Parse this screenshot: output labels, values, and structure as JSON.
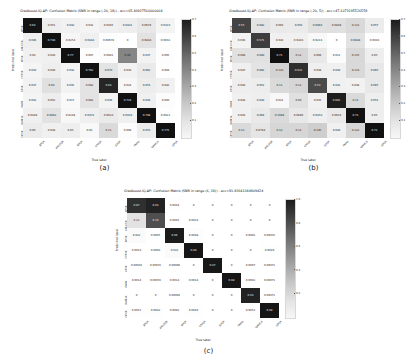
{
  "figure": {
    "background": "#ffffff",
    "colormap": "greys",
    "panels_layout": "2 on top, 1 centered below"
  },
  "panels": [
    {
      "key": "a",
      "panel_label": "(a)",
      "title": "Gradboost-IQ-AP: Confusion Matrix (SNR in range (-20, 18)) - acc=65.46937560000004",
      "xlabel": "True label",
      "ylabel": "Predicted label",
      "colorbar": {
        "ticks": [
          "0.7",
          "0.6",
          "0.5",
          "0.4",
          "0.3",
          "0.2",
          "0.1"
        ],
        "vmin": 0.0,
        "vmax": 0.7
      }
    },
    {
      "key": "b",
      "panel_label": "(b)",
      "title": "Gradboost-IQ-AP: Confusion Matrix (SNR in range (-20, 5)) - acc=47.1073195526558",
      "xlabel": "True label",
      "ylabel": "Predicted label",
      "colorbar": {
        "ticks": [
          "0.7",
          "0.6",
          "0.5",
          "0.4",
          "0.3",
          "0.2",
          "0.1"
        ],
        "vmin": 0.0,
        "vmax": 0.7
      }
    },
    {
      "key": "c",
      "panel_label": "(c)",
      "title": "Gradboost-IQ-AP: Confusion Matrix (SNR in range (6, 18)) - acc=91.83641344909424",
      "xlabel": "True label",
      "ylabel": "Predicted label",
      "colorbar": {
        "ticks": [
          "1.0",
          "0.8",
          "0.6",
          "0.4",
          "0.2"
        ],
        "vmin": 0.0,
        "vmax": 1.0
      }
    }
  ],
  "chart_data": [
    {
      "type": "heatmap",
      "panel": "a",
      "title": "Gradboost-IQ-AP: Confusion Matrix (SNR in range (-20, 18)) - acc=65.46937560000004",
      "xlabel": "True label",
      "ylabel": "Predicted label",
      "xticklabels": [
        "8PSK",
        "AM-DSB",
        "BPSK",
        "CPFSK",
        "GFSK",
        "PAM4",
        "QAM16",
        "QPSK"
      ],
      "yticklabels": [
        "8PSK",
        "AM-DSB",
        "BPSK",
        "CPFSK",
        "GFSK",
        "PAM4",
        "QAM16",
        "QPSK"
      ],
      "zlim": [
        0.0,
        0.7
      ],
      "values": [
        [
          0.69,
          0.051,
          0.042,
          0.032,
          0.0445,
          0.0491,
          0.0678,
          0.0319
        ],
        [
          0.046,
          0.744,
          0.0254,
          0.0444,
          0.00674,
          0.0,
          0.0844,
          0.0031
        ],
        [
          0.04,
          0.043,
          0.77,
          0.007,
          0.0081,
          0.36,
          0.037,
          0.005
        ],
        [
          0.033,
          0.049,
          0.032,
          0.762,
          0.079,
          0.039,
          0.062,
          0.004
        ],
        [
          0.037,
          0.09,
          0.035,
          0.082,
          0.64,
          0.024,
          0.053,
          0.042
        ],
        [
          0.032,
          0.052,
          0.017,
          0.082,
          0.036,
          0.714,
          0.044,
          0.009
        ],
        [
          0.0448,
          0.0862,
          0.0248,
          0.0472,
          0.0619,
          0.0433,
          0.748,
          0.0021
        ],
        [
          0.06,
          0.044,
          0.05,
          0.02,
          0.11,
          0.008,
          0.053,
          0.771
        ]
      ]
    },
    {
      "type": "heatmap",
      "panel": "b",
      "title": "Gradboost-IQ-AP: Confusion Matrix (SNR in range (-20, 5)) - acc=47.1073195526558",
      "xlabel": "True label",
      "ylabel": "Predicted label",
      "xticklabels": [
        "8PSK",
        "AM-DSB",
        "BPSK",
        "CPFSK",
        "GFSK",
        "PAM4",
        "QAM16",
        "QPSK"
      ],
      "yticklabels": [
        "8PSK",
        "AM-DSB",
        "BPSK",
        "CPFSK",
        "GFSK",
        "PAM4",
        "QAM16",
        "QPSK"
      ],
      "zlim": [
        0.0,
        0.7
      ],
      "values": [
        [
          0.55,
          0.082,
          0.063,
          0.059,
          0.0869,
          0.0898,
          0.112,
          0.057
        ],
        [
          0.036,
          0.571,
          0.043,
          0.0443,
          0.0213,
          0.0,
          0.0848,
          0.0043
        ],
        [
          0.088,
          0.089,
          0.71,
          0.12,
          0.068,
          0.011,
          0.115,
          0.05
        ],
        [
          0.047,
          0.082,
          0.129,
          0.611,
          0.048,
          0.044,
          0.113,
          0.067
        ],
        [
          0.049,
          0.052,
          0.11,
          0.12,
          0.53,
          0.041,
          0.038,
          0.067
        ],
        [
          0.044,
          0.049,
          0.021,
          0.09,
          0.041,
          0.662,
          0.11,
          0.051
        ],
        [
          0.043,
          0.064,
          0.1088,
          0.0686,
          0.0459,
          0.0654,
          0.71,
          0.05
        ],
        [
          0.11,
          0.0764,
          0.12,
          0.12,
          0.145,
          0.043,
          0.122,
          0.71
        ]
      ]
    },
    {
      "type": "heatmap",
      "panel": "c",
      "title": "Gradboost-IQ-AP: Confusion Matrix (SNR in range (6, 18)) - acc=91.83641344909424",
      "xlabel": "True label",
      "ylabel": "Predicted label",
      "xticklabels": [
        "8PSK",
        "AM-DSB",
        "BPSK",
        "CPFSK",
        "GFSK",
        "PAM4",
        "QAM16",
        "QPSK"
      ],
      "yticklabels": [
        "8PSK",
        "AM-DSB",
        "BPSK",
        "CPFSK",
        "GFSK",
        "PAM4",
        "QAM16",
        "QPSK"
      ],
      "zlim": [
        0.0,
        1.0
      ],
      "values": [
        [
          0.87,
          0.93,
          0.0044,
          0.0,
          0.0,
          0.0,
          0.0,
          0.0
        ],
        [
          0.12,
          0.74,
          0.0001,
          0.0014,
          0.0,
          0.0,
          0.0,
          0.0
        ],
        [
          0.022,
          0.0005,
          0.96,
          0.0098,
          0.0,
          0.0,
          0.0002,
          0.00072
        ],
        [
          0.0019,
          0.0009,
          0.022,
          0.98,
          0.0,
          0.0,
          0.0,
          0.0028
        ],
        [
          0.00033,
          0.00072,
          0.00066,
          0.0,
          0.97,
          0.0,
          0.0007,
          0.00071
        ],
        [
          0.0014,
          0.00072,
          0.0014,
          0.0014,
          0.0,
          0.98,
          0.0002,
          0.00071
        ],
        [
          0.0,
          0.0,
          0.00069,
          0.0,
          0.0,
          0.0,
          0.93,
          0.00071
        ],
        [
          0.0051,
          0.0042,
          0.0002,
          0.0043,
          0.0,
          0.0,
          0.0052,
          0.98
        ]
      ]
    }
  ]
}
